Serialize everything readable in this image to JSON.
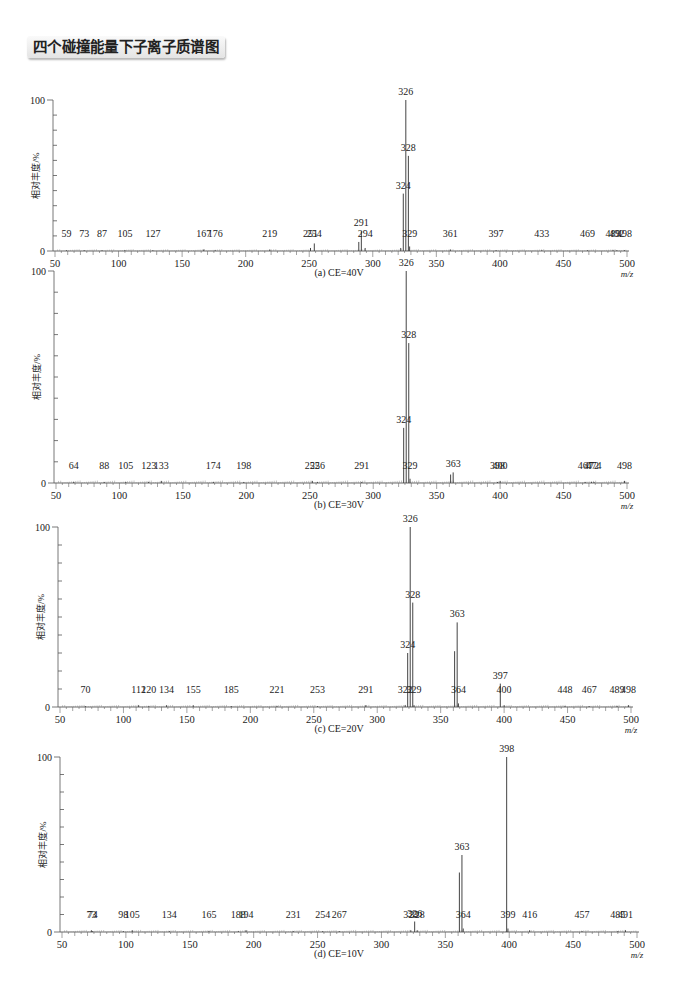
{
  "page_title": "四个碰撞能量下子离子质谱图",
  "chart_data": [
    {
      "type": "bar",
      "subtype": "mass_spectrum",
      "title": "(a) CE=40V",
      "xlabel": "m/z",
      "ylabel": "相对丰度/%",
      "xlim": [
        50,
        500
      ],
      "ylim": [
        0,
        100
      ],
      "xticks": [
        50,
        100,
        150,
        200,
        250,
        300,
        350,
        400,
        450,
        500
      ],
      "yticks_labeled": [
        0,
        100
      ],
      "grid": false,
      "peaks": [
        {
          "mz": 59,
          "intensity": 0.5,
          "label": "59"
        },
        {
          "mz": 73,
          "intensity": 0.5,
          "label": "73"
        },
        {
          "mz": 87,
          "intensity": 0.5,
          "label": "87"
        },
        {
          "mz": 105,
          "intensity": 0.5,
          "label": "105"
        },
        {
          "mz": 127,
          "intensity": 0.5,
          "label": "127"
        },
        {
          "mz": 167,
          "intensity": 1,
          "label": "167"
        },
        {
          "mz": 176,
          "intensity": 0.5,
          "label": "176"
        },
        {
          "mz": 219,
          "intensity": 1,
          "label": "219"
        },
        {
          "mz": 251,
          "intensity": 2,
          "label": "251"
        },
        {
          "mz": 254,
          "intensity": 5,
          "label": "254"
        },
        {
          "mz": 289,
          "intensity": 6,
          "label": ""
        },
        {
          "mz": 291,
          "intensity": 13,
          "label": "291"
        },
        {
          "mz": 294,
          "intensity": 2,
          "label": "294"
        },
        {
          "mz": 322,
          "intensity": 2,
          "label": ""
        },
        {
          "mz": 324,
          "intensity": 38,
          "label": "324"
        },
        {
          "mz": 326,
          "intensity": 100,
          "label": "326"
        },
        {
          "mz": 328,
          "intensity": 63,
          "label": "328"
        },
        {
          "mz": 329,
          "intensity": 3,
          "label": "329"
        },
        {
          "mz": 361,
          "intensity": 1,
          "label": "361"
        },
        {
          "mz": 397,
          "intensity": 0.5,
          "label": "397"
        },
        {
          "mz": 433,
          "intensity": 0.5,
          "label": "433"
        },
        {
          "mz": 469,
          "intensity": 0.5,
          "label": "469"
        },
        {
          "mz": 489,
          "intensity": 0.5,
          "label": "489"
        },
        {
          "mz": 492,
          "intensity": 0.5,
          "label": "492"
        },
        {
          "mz": 498,
          "intensity": 0.5,
          "label": "498"
        }
      ]
    },
    {
      "type": "bar",
      "subtype": "mass_spectrum",
      "title": "(b) CE=30V",
      "xlabel": "m/z",
      "ylabel": "相对丰度/%",
      "xlim": [
        50,
        500
      ],
      "ylim": [
        0,
        100
      ],
      "xticks": [
        50,
        100,
        150,
        200,
        250,
        300,
        350,
        400,
        450,
        500
      ],
      "yticks_labeled": [
        0,
        100
      ],
      "grid": false,
      "peaks": [
        {
          "mz": 64,
          "intensity": 0.5,
          "label": "64"
        },
        {
          "mz": 88,
          "intensity": 0.5,
          "label": "88"
        },
        {
          "mz": 105,
          "intensity": 0.5,
          "label": "105"
        },
        {
          "mz": 123,
          "intensity": 0.5,
          "label": "123"
        },
        {
          "mz": 133,
          "intensity": 1,
          "label": "133"
        },
        {
          "mz": 174,
          "intensity": 0.5,
          "label": "174"
        },
        {
          "mz": 198,
          "intensity": 0.5,
          "label": "198"
        },
        {
          "mz": 252,
          "intensity": 1,
          "label": "252"
        },
        {
          "mz": 256,
          "intensity": 0.5,
          "label": "256"
        },
        {
          "mz": 291,
          "intensity": 0.5,
          "label": "291"
        },
        {
          "mz": 324,
          "intensity": 26,
          "label": "324"
        },
        {
          "mz": 326,
          "intensity": 100,
          "label": "326"
        },
        {
          "mz": 328,
          "intensity": 66,
          "label": "328"
        },
        {
          "mz": 329,
          "intensity": 2,
          "label": "329"
        },
        {
          "mz": 361,
          "intensity": 4,
          "label": ""
        },
        {
          "mz": 363,
          "intensity": 5,
          "label": "363"
        },
        {
          "mz": 398,
          "intensity": 0.5,
          "label": "398"
        },
        {
          "mz": 400,
          "intensity": 1,
          "label": "400"
        },
        {
          "mz": 467,
          "intensity": 0.5,
          "label": "467"
        },
        {
          "mz": 472,
          "intensity": 0.5,
          "label": "472"
        },
        {
          "mz": 474,
          "intensity": 0.5,
          "label": "474"
        },
        {
          "mz": 498,
          "intensity": 1,
          "label": "498"
        }
      ]
    },
    {
      "type": "bar",
      "subtype": "mass_spectrum",
      "title": "(c) CE=20V",
      "xlabel": "m/z",
      "ylabel": "相对丰度/%",
      "xlim": [
        50,
        500
      ],
      "ylim": [
        0,
        100
      ],
      "xticks": [
        50,
        100,
        150,
        200,
        250,
        300,
        350,
        400,
        450,
        500
      ],
      "yticks_labeled": [
        0,
        100
      ],
      "grid": false,
      "peaks": [
        {
          "mz": 70,
          "intensity": 0.5,
          "label": "70"
        },
        {
          "mz": 112,
          "intensity": 1,
          "label": "112"
        },
        {
          "mz": 120,
          "intensity": 0.5,
          "label": "120"
        },
        {
          "mz": 134,
          "intensity": 1,
          "label": "134"
        },
        {
          "mz": 155,
          "intensity": 1,
          "label": "155"
        },
        {
          "mz": 185,
          "intensity": 0.5,
          "label": "185"
        },
        {
          "mz": 221,
          "intensity": 0.5,
          "label": "221"
        },
        {
          "mz": 253,
          "intensity": 0.5,
          "label": "253"
        },
        {
          "mz": 291,
          "intensity": 1,
          "label": "291"
        },
        {
          "mz": 322,
          "intensity": 1,
          "label": "322"
        },
        {
          "mz": 324,
          "intensity": 30,
          "label": "324"
        },
        {
          "mz": 326,
          "intensity": 100,
          "label": "326"
        },
        {
          "mz": 328,
          "intensity": 58,
          "label": "328"
        },
        {
          "mz": 329,
          "intensity": 1,
          "label": "329"
        },
        {
          "mz": 361,
          "intensity": 31,
          "label": ""
        },
        {
          "mz": 363,
          "intensity": 47,
          "label": "363"
        },
        {
          "mz": 364,
          "intensity": 2,
          "label": "364"
        },
        {
          "mz": 397,
          "intensity": 13,
          "label": "397"
        },
        {
          "mz": 400,
          "intensity": 1,
          "label": "400"
        },
        {
          "mz": 448,
          "intensity": 0.5,
          "label": "448"
        },
        {
          "mz": 467,
          "intensity": 0.5,
          "label": "467"
        },
        {
          "mz": 489,
          "intensity": 0.5,
          "label": "489"
        },
        {
          "mz": 498,
          "intensity": 1,
          "label": "498"
        }
      ]
    },
    {
      "type": "bar",
      "subtype": "mass_spectrum",
      "title": "(d) CE=10V",
      "xlabel": "m/z",
      "ylabel": "相对丰度/%",
      "xlim": [
        50,
        500
      ],
      "ylim": [
        0,
        100
      ],
      "xticks": [
        50,
        100,
        150,
        200,
        250,
        300,
        350,
        400,
        450,
        500
      ],
      "yticks_labeled": [
        0,
        100
      ],
      "grid": false,
      "peaks": [
        {
          "mz": 73,
          "intensity": 1,
          "label": "73"
        },
        {
          "mz": 74,
          "intensity": 0.5,
          "label": "74"
        },
        {
          "mz": 98,
          "intensity": 0.5,
          "label": "98"
        },
        {
          "mz": 105,
          "intensity": 1,
          "label": "105"
        },
        {
          "mz": 134,
          "intensity": 0.5,
          "label": "134"
        },
        {
          "mz": 165,
          "intensity": 0.5,
          "label": "165"
        },
        {
          "mz": 188,
          "intensity": 0.5,
          "label": "188"
        },
        {
          "mz": 194,
          "intensity": 1,
          "label": "194"
        },
        {
          "mz": 231,
          "intensity": 0.5,
          "label": "231"
        },
        {
          "mz": 254,
          "intensity": 0.5,
          "label": "254"
        },
        {
          "mz": 267,
          "intensity": 0.5,
          "label": "267"
        },
        {
          "mz": 323,
          "intensity": 1,
          "label": "323"
        },
        {
          "mz": 326,
          "intensity": 6,
          "label": "326"
        },
        {
          "mz": 328,
          "intensity": 1,
          "label": "328"
        },
        {
          "mz": 361,
          "intensity": 34,
          "label": ""
        },
        {
          "mz": 363,
          "intensity": 44,
          "label": "363"
        },
        {
          "mz": 364,
          "intensity": 2,
          "label": "364"
        },
        {
          "mz": 398,
          "intensity": 100,
          "label": "398"
        },
        {
          "mz": 399,
          "intensity": 2,
          "label": "399"
        },
        {
          "mz": 416,
          "intensity": 1,
          "label": "416"
        },
        {
          "mz": 457,
          "intensity": 0.5,
          "label": "457"
        },
        {
          "mz": 485,
          "intensity": 0.5,
          "label": "485"
        },
        {
          "mz": 491,
          "intensity": 1,
          "label": "491"
        }
      ]
    }
  ]
}
